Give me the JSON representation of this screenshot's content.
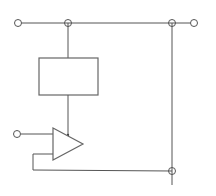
{
  "diagram": {
    "type": "circuit-schematic",
    "colors": {
      "line": "#555555",
      "background": "#ffffff"
    },
    "components": [
      {
        "id": "block",
        "kind": "rectangle-block",
        "label": ""
      },
      {
        "id": "amp",
        "kind": "amplifier-triangle",
        "label": ""
      }
    ],
    "terminals": [
      {
        "id": "in-top-left",
        "kind": "open-terminal"
      },
      {
        "id": "out-top-right",
        "kind": "open-terminal"
      },
      {
        "id": "in-amp-left",
        "kind": "open-terminal"
      }
    ],
    "junctions": [
      {
        "id": "top-junction"
      },
      {
        "id": "right-top-junction"
      },
      {
        "id": "right-bottom-junction"
      }
    ],
    "text_labels": []
  }
}
